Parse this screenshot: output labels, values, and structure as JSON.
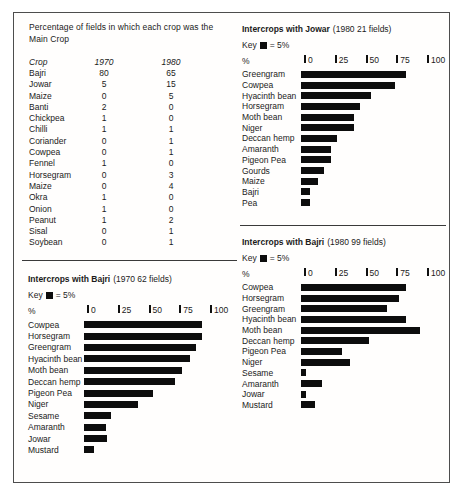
{
  "figure": {
    "background": "#ffffff",
    "frame_border_color": "#4d4d4d",
    "bar_color": "#0d0d0d",
    "text_color": "#1b1b1b"
  },
  "main_table": {
    "heading_lines": [
      "Percentage of fields in which each crop was the",
      "Main Crop"
    ],
    "columns": [
      "Crop",
      "1970",
      "1980"
    ],
    "rows": [
      [
        "Bajri",
        "80",
        "65"
      ],
      [
        "Jowar",
        "5",
        "15"
      ],
      [
        "Maize",
        "0",
        "5"
      ],
      [
        "Banti",
        "2",
        "0"
      ],
      [
        "Chickpea",
        "1",
        "0"
      ],
      [
        "Chilli",
        "1",
        "1"
      ],
      [
        "Coriander",
        "0",
        "1"
      ],
      [
        "Cowpea",
        "0",
        "1"
      ],
      [
        "Fennel",
        "1",
        "0"
      ],
      [
        "Horsegram",
        "0",
        "3"
      ],
      [
        "Maize",
        "0",
        "4"
      ],
      [
        "Okra",
        "1",
        "0"
      ],
      [
        "Onion",
        "1",
        "0"
      ],
      [
        "Peanut",
        "1",
        "2"
      ],
      [
        "Sisal",
        "0",
        "1"
      ],
      [
        "Soybean",
        "0",
        "1"
      ]
    ]
  },
  "chart_data": [
    {
      "id": "jowar-1980",
      "type": "bar",
      "title": "Intercrops with Jowar",
      "subtitle": "(1980 21 fields)",
      "key_label": "Key",
      "key_equals": "= 5%",
      "axis_label": "%",
      "xlim": [
        0,
        100
      ],
      "ticks": [
        0,
        25,
        50,
        75,
        100
      ],
      "categories": [
        "Greengram",
        "Cowpea",
        "Hyacinth bean",
        "Horsegram",
        "Moth bean",
        "Niger",
        "Deccan hemp",
        "Amaranth",
        "Pigeon Pea",
        "Gourds",
        "Maize",
        "Bajri",
        "Pea"
      ],
      "values": [
        85,
        76,
        57,
        48,
        43,
        43,
        29,
        24,
        24,
        19,
        14,
        7,
        7
      ]
    },
    {
      "id": "bajri-1970",
      "type": "bar",
      "title": "Intercrops with Bajri",
      "subtitle": "(1970 62 fields)",
      "key_label": "Key",
      "key_equals": "= 5%",
      "axis_label": "%",
      "xlim": [
        0,
        100
      ],
      "ticks": [
        0,
        25,
        50,
        75,
        100
      ],
      "categories": [
        "Cowpea",
        "Horsegram",
        "Greengram",
        "Hyacinth bean",
        "Moth bean",
        "Deccan hemp",
        "Pigeon Pea",
        "Niger",
        "Sesame",
        "Amaranth",
        "Jowar",
        "Mustard"
      ],
      "values": [
        96,
        96,
        91,
        86,
        80,
        74,
        56,
        44,
        22,
        18,
        19,
        8
      ]
    },
    {
      "id": "bajri-1980",
      "type": "bar",
      "title": "Intercrops with Bajri",
      "subtitle": "(1980 99 fields)",
      "key_label": "Key",
      "key_equals": "= 5%",
      "axis_label": "%",
      "xlim": [
        0,
        100
      ],
      "ticks": [
        0,
        25,
        50,
        75,
        100
      ],
      "categories": [
        "Cowpea",
        "Horsegram",
        "Greengram",
        "Hyacinth bean",
        "Moth bean",
        "Deccan hemp",
        "Pigeon Pea",
        "Niger",
        "Sesame",
        "Amaranth",
        "Jowar",
        "Mustard"
      ],
      "values": [
        85,
        80,
        70,
        85,
        97,
        55,
        33,
        40,
        4,
        17,
        4,
        11
      ]
    }
  ]
}
